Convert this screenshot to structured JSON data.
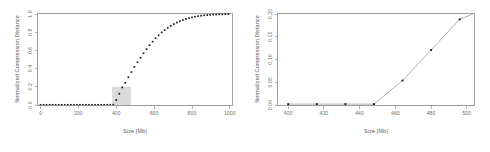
{
  "figure": {
    "background": "#ffffff",
    "point_color": "#1a1a1a",
    "line_color": "#8d8d8d",
    "axis_color": "#999999",
    "highlight_color": "#d4d4d4"
  },
  "panels": {
    "left": {
      "name": "overview-plot",
      "xlabel": "Size [Mb]",
      "ylabel": "Normalized Compression Distance",
      "xticks": [
        "0",
        "200",
        "400",
        "600",
        "800",
        "1000"
      ],
      "yticks": [
        "0.0",
        "0.2",
        "0.4",
        "0.6",
        "0.8",
        "1.0"
      ],
      "highlight": {
        "label": "zoom-region",
        "x0": 400,
        "x1": 500,
        "y0": 0.0,
        "y1": 0.2
      }
    },
    "right": {
      "name": "detail-plot",
      "xlabel": "Size [Mb]",
      "ylabel": "Normalized Compression Distance",
      "xticks": [
        "400",
        "420",
        "440",
        "460",
        "480",
        "500"
      ],
      "yticks": [
        "0.00",
        "0.05",
        "0.10",
        "0.15",
        "0.20"
      ]
    }
  },
  "chart_data": [
    {
      "type": "scatter",
      "panel": "left",
      "title": "",
      "xlabel": "Size [Mb]",
      "ylabel": "Normalized Compression Distance",
      "xlim": [
        0,
        1030
      ],
      "ylim": [
        0.0,
        1.0
      ],
      "xticks": [
        0,
        200,
        400,
        600,
        800,
        1000
      ],
      "yticks": [
        0.0,
        0.2,
        0.4,
        0.6,
        0.8,
        1.0
      ],
      "grid": false,
      "legend": null,
      "markers": "filled-square",
      "x": [
        16,
        32,
        48,
        64,
        80,
        96,
        112,
        128,
        144,
        160,
        176,
        192,
        208,
        224,
        240,
        256,
        272,
        288,
        304,
        320,
        336,
        352,
        368,
        384,
        400,
        416,
        432,
        448,
        464,
        480,
        496,
        512,
        528,
        544,
        560,
        576,
        592,
        608,
        624,
        640,
        656,
        672,
        688,
        704,
        720,
        736,
        752,
        768,
        784,
        800,
        816,
        832,
        848,
        864,
        880,
        896,
        912,
        928,
        944,
        960,
        976,
        992,
        1008
      ],
      "y": [
        0.002,
        0.002,
        0.002,
        0.002,
        0.002,
        0.002,
        0.002,
        0.002,
        0.002,
        0.002,
        0.002,
        0.002,
        0.002,
        0.002,
        0.002,
        0.002,
        0.002,
        0.002,
        0.002,
        0.002,
        0.002,
        0.002,
        0.002,
        0.003,
        0.003,
        0.055,
        0.124,
        0.193,
        0.243,
        0.305,
        0.362,
        0.418,
        0.47,
        0.52,
        0.568,
        0.614,
        0.657,
        0.697,
        0.733,
        0.766,
        0.797,
        0.824,
        0.848,
        0.87,
        0.889,
        0.906,
        0.921,
        0.934,
        0.945,
        0.955,
        0.963,
        0.97,
        0.976,
        0.981,
        0.985,
        0.988,
        0.991,
        0.993,
        0.994,
        0.996,
        0.997,
        0.998,
        0.999
      ]
    },
    {
      "type": "line",
      "panel": "right",
      "title": "",
      "xlabel": "Size [Mb]",
      "ylabel": "Normalized Compression Distance",
      "xlim": [
        394,
        504
      ],
      "ylim": [
        0.0,
        0.205
      ],
      "xticks": [
        400,
        420,
        440,
        460,
        480,
        500
      ],
      "yticks": [
        0.0,
        0.05,
        0.1,
        0.15,
        0.2
      ],
      "grid": false,
      "legend": null,
      "markers": "filled-square",
      "x": [
        400,
        416,
        432,
        448,
        464,
        480,
        496
      ],
      "y": [
        0.002,
        0.002,
        0.002,
        0.002,
        0.055,
        0.124,
        0.193
      ]
    }
  ]
}
